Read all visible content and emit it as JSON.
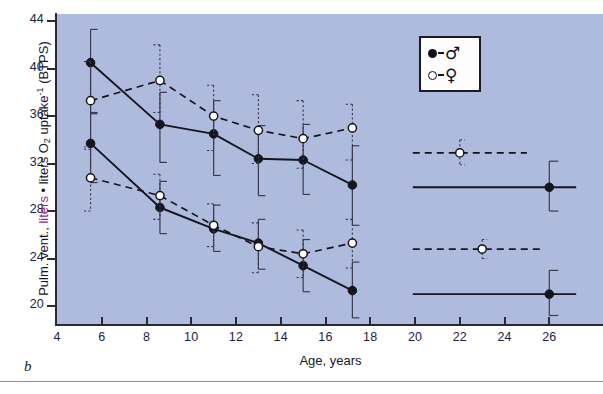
{
  "panel": {
    "label": "b"
  },
  "axes": {
    "y": {
      "title_parts": {
        "pre": "Pulm. vent., ",
        "highlight": "liters",
        "mid": " • liters O",
        "sub": "2",
        "post": " uptake",
        "sup": "-1",
        "tail": " (BTPS)"
      },
      "ticks": [
        20,
        24,
        28,
        32,
        36,
        40,
        44
      ],
      "min": 18.4,
      "max": 44.6,
      "highlight_color": "#8b2f8b"
    },
    "x": {
      "title": "Age, years",
      "ticks": [
        4,
        6,
        8,
        10,
        12,
        14,
        16,
        18,
        20,
        22,
        24,
        26
      ],
      "min": 4,
      "max": 28.4
    }
  },
  "legend": {
    "items": [
      {
        "label": "♂",
        "marker": "filled-circle",
        "name": "male"
      },
      {
        "label": "♀",
        "marker": "open-circle",
        "name": "female"
      }
    ]
  },
  "chart_data": {
    "type": "line",
    "title": "",
    "xlabel": "Age, years",
    "ylabel": "Pulm. vent., liters • liters O2 uptake-1 (BTPS)",
    "xlim": [
      4,
      28.4
    ],
    "ylim": [
      18.4,
      44.6
    ],
    "xticks": [
      4,
      6,
      8,
      10,
      12,
      14,
      16,
      18,
      20,
      22,
      24,
      26
    ],
    "yticks": [
      20,
      24,
      28,
      32,
      36,
      40,
      44
    ],
    "grid": false,
    "legend_position": "top-right",
    "plot_background": "#aebbdd",
    "series": [
      {
        "name": "Boys, upper set",
        "sex": "male",
        "marker": "filled-circle",
        "linestyle": "solid",
        "points": [
          {
            "x": 5.5,
            "y": 40.5,
            "err_low": 36.2,
            "err_high": 43.3
          },
          {
            "x": 8.6,
            "y": 35.3,
            "err_low": 32.1,
            "err_high": 38.0
          },
          {
            "x": 11.0,
            "y": 34.5,
            "err_low": 31.0,
            "err_high": 37.3
          },
          {
            "x": 13.0,
            "y": 32.4,
            "err_low": 29.3,
            "err_high": 35.2
          },
          {
            "x": 15.0,
            "y": 32.3,
            "err_low": 29.4,
            "err_high": 35.3
          },
          {
            "x": 17.2,
            "y": 30.2,
            "err_low": 26.8,
            "err_high": 33.5
          }
        ]
      },
      {
        "name": "Girls, upper set",
        "sex": "female",
        "marker": "open-circle",
        "linestyle": "dashed",
        "points": [
          {
            "x": 5.5,
            "y": 37.3,
            "err_low": 33.4,
            "err_high": 40.6
          },
          {
            "x": 8.6,
            "y": 39.0,
            "err_low": 36.3,
            "err_high": 42.0
          },
          {
            "x": 11.0,
            "y": 36.0,
            "err_low": 33.1,
            "err_high": 38.6
          },
          {
            "x": 13.0,
            "y": 34.8,
            "err_low": 32.0,
            "err_high": 37.8
          },
          {
            "x": 15.0,
            "y": 34.1,
            "err_low": 31.6,
            "err_high": 37.3
          },
          {
            "x": 17.2,
            "y": 35.0,
            "err_low": 32.3,
            "err_high": 37.0
          }
        ]
      },
      {
        "name": "Boys, lower set",
        "sex": "male",
        "marker": "filled-circle",
        "linestyle": "solid",
        "points": [
          {
            "x": 5.5,
            "y": 33.7,
            "err_low": 30.4,
            "err_high": 36.3
          },
          {
            "x": 8.6,
            "y": 28.3,
            "err_low": 26.1,
            "err_high": 30.5
          },
          {
            "x": 11.0,
            "y": 26.5,
            "err_low": 24.6,
            "err_high": 28.5
          },
          {
            "x": 13.0,
            "y": 25.3,
            "err_low": 23.1,
            "err_high": 27.3
          },
          {
            "x": 15.0,
            "y": 23.4,
            "err_low": 21.2,
            "err_high": 25.6
          },
          {
            "x": 17.2,
            "y": 21.3,
            "err_low": 19.0,
            "err_high": 23.7
          }
        ]
      },
      {
        "name": "Girls, lower set",
        "sex": "female",
        "marker": "open-circle",
        "linestyle": "dashed",
        "points": [
          {
            "x": 5.5,
            "y": 30.8,
            "err_low": 28.0,
            "err_high": 33.2
          },
          {
            "x": 8.6,
            "y": 29.3,
            "err_low": 27.3,
            "err_high": 31.1
          },
          {
            "x": 11.0,
            "y": 26.8,
            "err_low": 25.0,
            "err_high": 28.6
          },
          {
            "x": 13.0,
            "y": 25.0,
            "err_low": 22.8,
            "err_high": 27.0
          },
          {
            "x": 15.0,
            "y": 24.4,
            "err_low": 22.4,
            "err_high": 26.4
          },
          {
            "x": 17.2,
            "y": 25.3,
            "err_low": 23.2,
            "err_high": 27.3
          }
        ]
      }
    ],
    "adult_references": [
      {
        "name": "Adult women, upper set",
        "sex": "female",
        "marker": "open-circle",
        "linestyle": "dashed",
        "y": 32.9,
        "x": 22.0,
        "x_start": 19.9,
        "x_end": 25.0,
        "err_low": 31.9,
        "err_high": 34.0
      },
      {
        "name": "Adult men, upper set",
        "sex": "male",
        "marker": "filled-circle",
        "linestyle": "solid",
        "y": 30.0,
        "x": 26.0,
        "x_start": 19.9,
        "x_end": 27.2,
        "err_low": 28.0,
        "err_high": 32.2
      },
      {
        "name": "Adult women, lower set",
        "sex": "female",
        "marker": "open-circle",
        "linestyle": "dashed",
        "y": 24.8,
        "x": 23.0,
        "x_start": 19.9,
        "x_end": 25.6,
        "err_low": 24.0,
        "err_high": 25.6
      },
      {
        "name": "Adult men, lower set",
        "sex": "male",
        "marker": "filled-circle",
        "linestyle": "solid",
        "y": 21.0,
        "x": 26.0,
        "x_start": 19.9,
        "x_end": 27.2,
        "err_low": 19.2,
        "err_high": 23.0
      }
    ]
  }
}
